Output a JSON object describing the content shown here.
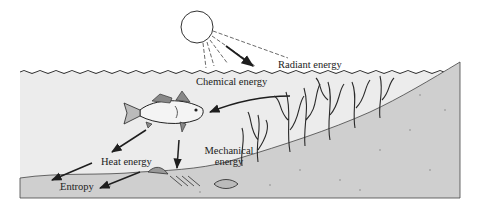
{
  "figure": {
    "type": "energy-flow-diagram",
    "elements": [
      "sun",
      "water-surface",
      "fish",
      "seaweed",
      "seabed",
      "dead-fish"
    ],
    "colors": {
      "background": "#ffffff",
      "water": "#ececec",
      "seabed": "#cfcfcf",
      "ink": "#1e1e1e"
    }
  },
  "labels": {
    "radiant": "Radiant energy",
    "chemical": "Chemical energy",
    "mechanical_line1": "Mechanical",
    "mechanical_line2": "energy",
    "heat": "Heat energy",
    "entropy": "Entropy"
  },
  "flows": [
    {
      "from": "sun",
      "to": "seaweed",
      "label": "Radiant energy"
    },
    {
      "from": "seaweed",
      "to": "fish",
      "label": "Chemical energy"
    },
    {
      "from": "fish",
      "to": "seabed",
      "label": "Mechanical energy"
    },
    {
      "from": "fish",
      "to": "environment",
      "label": "Heat energy"
    },
    {
      "from": "environment",
      "to": "sink",
      "label": "Entropy"
    }
  ]
}
